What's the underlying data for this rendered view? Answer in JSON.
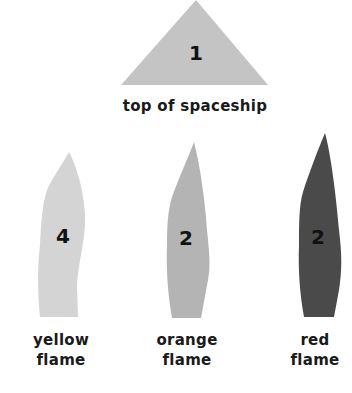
{
  "diagram": {
    "parts": [
      {
        "id": "top",
        "label": "top of spaceship",
        "count": "1",
        "color": "#c4c4c4"
      },
      {
        "id": "yellow",
        "label_line1": "yellow",
        "label_line2": "flame",
        "count": "4",
        "color": "#d4d4d4"
      },
      {
        "id": "orange",
        "label_line1": "orange",
        "label_line2": "flame",
        "count": "2",
        "color": "#b4b4b4"
      },
      {
        "id": "red",
        "label_line1": "red",
        "label_line2": "flame",
        "count": "2",
        "color": "#4a4a4a"
      }
    ]
  }
}
